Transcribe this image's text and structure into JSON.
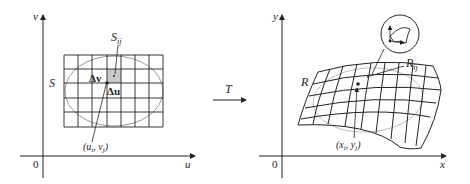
{
  "left_panel": {
    "axis_v": "v",
    "axis_u": "u",
    "origin": "0",
    "region_label": "S",
    "subrect_label": "S",
    "subrect_sub": "ij",
    "delta_v": "Δv",
    "delta_u": "Δu",
    "point_label": "(u",
    "point_sub_i": "i",
    "point_mid": ", v",
    "point_sub_j": "j",
    "point_close": ")"
  },
  "transform": {
    "label": "T"
  },
  "right_panel": {
    "axis_y": "y",
    "axis_x": "x",
    "origin": "0",
    "region_label": "R",
    "subregion_label": "R",
    "subregion_sub": "ij",
    "point_label": "(x",
    "point_sub_i": "i",
    "point_mid": ", y",
    "point_sub_j": "j",
    "point_close": ")"
  },
  "colors": {
    "line": "#222222",
    "ellipse": "#9a9a9a",
    "shade": "#c8c8c8"
  }
}
